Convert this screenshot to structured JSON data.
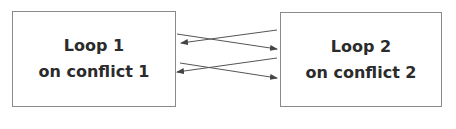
{
  "diagram": {
    "nodes": [
      {
        "id": "loop1",
        "line1": "Loop 1",
        "line2": "on conflict 1"
      },
      {
        "id": "loop2",
        "line1": "Loop 2",
        "line2": "on conflict 2"
      }
    ],
    "edges": [
      {
        "from": "loop1",
        "to": "loop2"
      },
      {
        "from": "loop2",
        "to": "loop1"
      },
      {
        "from": "loop1",
        "to": "loop2"
      },
      {
        "from": "loop2",
        "to": "loop1"
      }
    ],
    "colors": {
      "border": "#8a8a8a",
      "text": "#2b2b2b",
      "arrow": "#555555"
    }
  }
}
